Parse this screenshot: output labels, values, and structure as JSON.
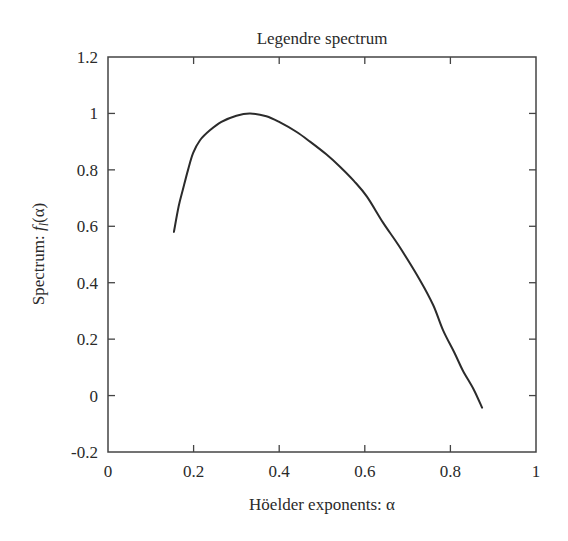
{
  "chart_data": {
    "type": "line",
    "title": "Legendre spectrum",
    "xlabel": "Höelder exponents: α",
    "ylabel": "Spectrum: f_l(α)",
    "ylabel_parts": {
      "prefix": "Spectrum: ",
      "func": "f",
      "sub": "l",
      "suffix": "(α)"
    },
    "xlim": [
      0,
      1
    ],
    "ylim": [
      -0.2,
      1.2
    ],
    "xticks": [
      0,
      0.2,
      0.4,
      0.6,
      0.8,
      1
    ],
    "xtick_labels": [
      "0",
      "0.2",
      "0.4",
      "0.6",
      "0.8",
      "1"
    ],
    "yticks": [
      -0.2,
      0,
      0.2,
      0.4,
      0.6,
      0.8,
      1,
      1.2
    ],
    "ytick_labels": [
      "-0.2",
      "0",
      "0.2",
      "0.4",
      "0.6",
      "0.8",
      "1",
      "1.2"
    ],
    "grid": false,
    "legend": null,
    "line_color": "#2b2b2b",
    "series": [
      {
        "name": "Legendre spectrum",
        "x": [
          0.154,
          0.165,
          0.175,
          0.187,
          0.199,
          0.215,
          0.238,
          0.265,
          0.3,
          0.332,
          0.37,
          0.402,
          0.44,
          0.472,
          0.51,
          0.542,
          0.575,
          0.605,
          0.643,
          0.68,
          0.729,
          0.76,
          0.783,
          0.81,
          0.829,
          0.855,
          0.874
        ],
        "y": [
          0.58,
          0.67,
          0.73,
          0.8,
          0.86,
          0.905,
          0.94,
          0.97,
          0.992,
          1.0,
          0.99,
          0.968,
          0.935,
          0.9,
          0.855,
          0.811,
          0.76,
          0.705,
          0.612,
          0.53,
          0.409,
          0.32,
          0.231,
          0.15,
          0.089,
          0.02,
          -0.043
        ]
      }
    ]
  }
}
